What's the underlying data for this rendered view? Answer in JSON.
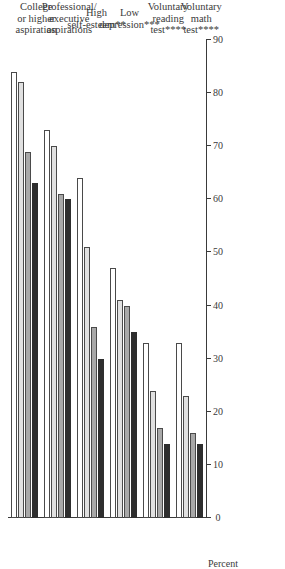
{
  "chart_data": {
    "type": "bar",
    "orientation": "horizontal",
    "title": "",
    "xlabel": "",
    "ylabel": "Percent",
    "axis_label": "Percent",
    "ylim": [
      0,
      90
    ],
    "tick_labels": [
      "90",
      "80",
      "70",
      "60",
      "50",
      "40",
      "30",
      "20",
      "10",
      "0"
    ],
    "tick_values": [
      90,
      80,
      70,
      60,
      50,
      40,
      30,
      20,
      10,
      0
    ],
    "grid": false,
    "legend_position": "none",
    "categories": [
      "College\nor higher\naspiration",
      "Professional/\nexecutive\naspirations",
      "High\nself-esteem**",
      "Low\ndepression***",
      "Voluntary\nreading\ntest****",
      "Voluntary\nmath\ntest****"
    ],
    "series": [
      {
        "name": "series-1",
        "color": "#ffffff",
        "values": [
          84,
          73,
          64,
          47,
          33,
          33
        ]
      },
      {
        "name": "series-2",
        "color": "#e0e0e0",
        "values": [
          82,
          70,
          51,
          41,
          24,
          23
        ]
      },
      {
        "name": "series-3",
        "color": "#a8a8a8",
        "values": [
          69,
          61,
          36,
          40,
          17,
          16
        ]
      },
      {
        "name": "series-4",
        "color": "#2e2e2e",
        "values": [
          63,
          60,
          30,
          35,
          14,
          14
        ]
      }
    ],
    "colors": {
      "series_1": "#ffffff",
      "series_2": "#e0e0e0",
      "series_3": "#a8a8a8",
      "series_4": "#2e2e2e",
      "axis": "#3a3a3a",
      "background": "#ffffff"
    }
  }
}
